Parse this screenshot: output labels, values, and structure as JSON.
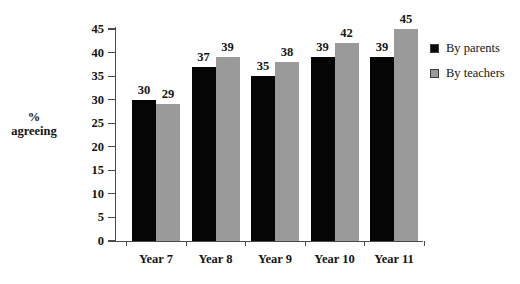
{
  "chart_data": {
    "type": "bar",
    "title": "",
    "subtitle": "",
    "xlabel": "",
    "ylabel_lines": [
      "%",
      "agreeing"
    ],
    "categories": [
      "Year 7",
      "Year 8",
      "Year 9",
      "Year 10",
      "Year 11"
    ],
    "series": [
      {
        "name": "By parents",
        "color": "#050505",
        "values": [
          30,
          37,
          35,
          39,
          39
        ]
      },
      {
        "name": "By teachers",
        "color": "#9a9a9a",
        "values": [
          29,
          39,
          38,
          42,
          45
        ]
      }
    ],
    "ylim": [
      0,
      45
    ],
    "ytick_labels": [
      "0",
      "5",
      "10",
      "15",
      "20",
      "25",
      "30",
      "35",
      "40",
      "45"
    ],
    "ytick_values": [
      0,
      5,
      10,
      15,
      20,
      25,
      30,
      35,
      40,
      45
    ],
    "grid": false,
    "data_labels": true,
    "legend_position": "right",
    "legend": [
      {
        "label": "By parents",
        "color": "#050505"
      },
      {
        "label": "By teachers",
        "color": "#9a9a9a"
      }
    ],
    "background_color": "#ffffff",
    "axis_color": "#4a4a4a"
  }
}
